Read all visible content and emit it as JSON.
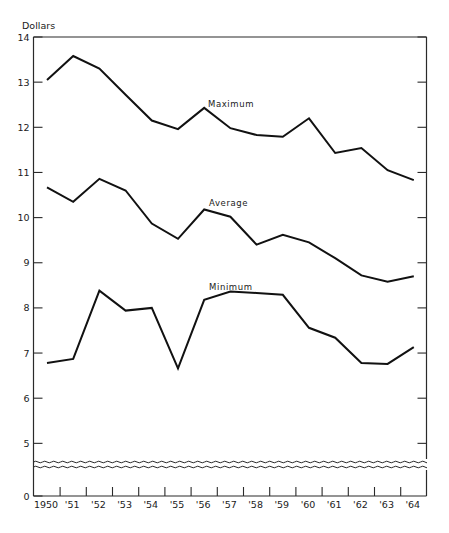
{
  "chart_data": {
    "type": "line",
    "title": "",
    "ylabel": "Dollars",
    "xlabel": "",
    "categories": [
      "1950",
      "'51",
      "'52",
      "'53",
      "'54",
      "'55",
      "'56",
      "'57",
      "'58",
      "'59",
      "'60",
      "'61",
      "'62",
      "'63",
      "'64"
    ],
    "x": [
      1950,
      1951,
      1952,
      1953,
      1954,
      1955,
      1956,
      1957,
      1958,
      1959,
      1960,
      1961,
      1962,
      1963,
      1964
    ],
    "series": [
      {
        "name": "Maximum",
        "values": [
          13.05,
          13.58,
          13.3,
          12.72,
          12.15,
          11.96,
          12.43,
          11.98,
          11.83,
          11.79,
          12.2,
          11.43,
          11.54,
          11.05,
          10.83
        ]
      },
      {
        "name": "Average",
        "values": [
          10.67,
          10.35,
          10.86,
          10.6,
          9.87,
          9.53,
          10.18,
          10.02,
          9.4,
          9.62,
          9.45,
          9.1,
          8.72,
          8.58,
          8.7
        ]
      },
      {
        "name": "Minimum",
        "values": [
          6.78,
          6.87,
          8.38,
          7.94,
          8.0,
          6.66,
          8.18,
          8.36,
          8.33,
          8.29,
          7.56,
          7.34,
          6.78,
          6.76,
          7.13
        ]
      }
    ],
    "yticks": [
      "0",
      "5",
      "6",
      "7",
      "8",
      "9",
      "10",
      "11",
      "12",
      "13",
      "14"
    ],
    "ylim": [
      0,
      14
    ],
    "axis_break": {
      "between": [
        0,
        5
      ]
    },
    "grid": false,
    "legend": "inline labels"
  },
  "labels": {
    "y_unit": "Dollars",
    "series_max": "Maximum",
    "series_avg": "Average",
    "series_min": "Minimum"
  },
  "colors": {
    "line": "#111111",
    "axis": "#2a2a2a",
    "background": "#ffffff"
  }
}
